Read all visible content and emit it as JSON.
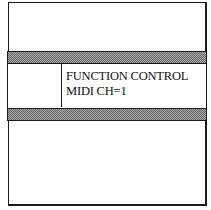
{
  "display": {
    "line1": "FUNCTION CONTROL",
    "line2": "MIDI CH=1"
  },
  "colors": {
    "border": "#1a1a1a",
    "stripe": "#8a8a8a",
    "background": "#ffffff"
  }
}
